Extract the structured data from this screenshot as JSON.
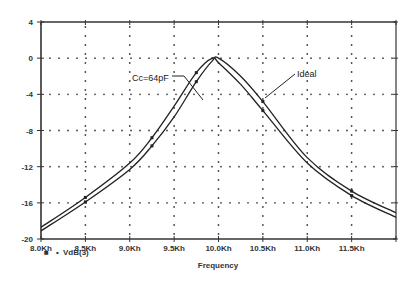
{
  "chart_data": {
    "type": "line",
    "title": "",
    "xlabel": "Frequency",
    "ylabel": "",
    "xlim": [
      8.0,
      12.0
    ],
    "ylim": [
      -20,
      4
    ],
    "grid": true,
    "x_ticks": [
      8.0,
      8.5,
      9.0,
      9.5,
      10.0,
      10.5,
      11.0,
      11.5
    ],
    "x_tick_labels": [
      "8.0Kh",
      "8.5Kh",
      "9.0Kh",
      "9.5Kh",
      "10.0Kh",
      "10.5Kh",
      "11.0Kh",
      "11.5Kh"
    ],
    "y_ticks": [
      4,
      0,
      -4,
      -8,
      -12,
      -16,
      -20
    ],
    "y_tick_labels": [
      "4",
      "0",
      "-4",
      "-8",
      "-12",
      "-16",
      "-20"
    ],
    "x": [
      8.0,
      8.5,
      9.0,
      9.25,
      9.5,
      9.75,
      9.93,
      10.0,
      10.25,
      10.5,
      11.0,
      11.5,
      12.0
    ],
    "series": [
      {
        "name": "Cc=64pF",
        "values": [
          -18.7,
          -15.4,
          -11.6,
          -8.8,
          -5.3,
          -1.6,
          0.0,
          -0.5,
          -2.9,
          -5.8,
          -11.6,
          -15.2,
          -17.6
        ]
      },
      {
        "name": "Ideal",
        "values": [
          -19.1,
          -15.9,
          -12.3,
          -9.7,
          -6.5,
          -2.6,
          -0.3,
          0.0,
          -2.0,
          -4.8,
          -11.0,
          -14.7,
          -17.1
        ]
      }
    ],
    "annotations": [
      {
        "text": "Cc=64pF",
        "points_to": "left curve near 9.6Kh, -4"
      },
      {
        "text": "Ideal",
        "points_to": "right curve near 10.4Kh, -4"
      }
    ],
    "legend": {
      "position": "bottom-left",
      "entries": [
        "VdB(3)"
      ]
    }
  },
  "labels": {
    "xlabel": "Frequency",
    "annot_left": "Cc=64pF",
    "annot_right": "Ideal",
    "legend_entry": "VdB(3)",
    "legend_marker": "■",
    "legend_bullet": "•"
  }
}
